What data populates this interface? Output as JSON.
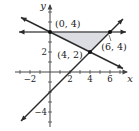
{
  "diagram": {
    "type": "coordinate-plane-feasible-region",
    "x_axis_label": "x",
    "y_axis_label": "y",
    "x_range": [
      -3.5,
      7.8
    ],
    "y_range": [
      -5.5,
      6.8
    ],
    "x_ticks": [
      -3,
      -2,
      -1,
      1,
      2,
      3,
      4,
      5,
      6,
      7
    ],
    "x_tick_labels": [
      {
        "value": -2,
        "text": "−2"
      },
      {
        "value": 2,
        "text": "2"
      },
      {
        "value": 4,
        "text": "4"
      },
      {
        "value": 6,
        "text": "6"
      }
    ],
    "y_ticks": [
      -5,
      -4,
      -3,
      -2,
      -1,
      1,
      2,
      3,
      4,
      5,
      6
    ],
    "y_tick_labels": [
      {
        "value": 2,
        "text": "2"
      },
      {
        "value": -4,
        "text": "−4"
      }
    ],
    "lines": [
      {
        "name": "y = 4",
        "from": [
          -3.1,
          4
        ],
        "to": [
          7.6,
          4
        ],
        "arrows": "both"
      },
      {
        "name": "y = -x/2 + 4",
        "from": [
          -2.9,
          5.45
        ],
        "to": [
          7.3,
          0.35
        ],
        "arrows": "both"
      },
      {
        "name": "y = x - 2",
        "from": [
          -2.9,
          -4.9
        ],
        "to": [
          7.3,
          5.3
        ],
        "arrows": "both"
      }
    ],
    "region": {
      "vertices": [
        [
          0,
          4
        ],
        [
          6,
          4
        ],
        [
          4,
          2
        ]
      ],
      "fill": "#dcdde3"
    },
    "points": [
      {
        "x": 0,
        "y": 4,
        "label": "(0, 4)",
        "label_pos": "upper-right"
      },
      {
        "x": 4,
        "y": 2,
        "label": "(4, 2)",
        "label_pos": "left"
      },
      {
        "x": 6,
        "y": 4,
        "label": "(6, 4)",
        "label_pos": "below"
      }
    ]
  }
}
